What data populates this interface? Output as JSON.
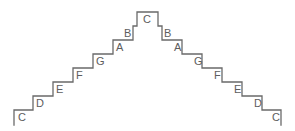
{
  "figure": {
    "name": "scale-staircase-diagram",
    "type": "diagram",
    "background_color": "#ffffff",
    "stroke_color": "#6a6a6a",
    "label_color": "#5d5d5d",
    "width": 295,
    "height": 131
  },
  "staircase": {
    "outline_path": "M 14,125 L 14,110 L 33,110 L 33,96 L 53,96 L 53,82 L 73,82 L 73,68 L 93,68 L 93,54 L 113,54 L 113,40 L 133,40 L 133,26 L 137,26 L 137,12 L 158,12 L 158,26 L 162,26 L 162,40 L 182,40 L 182,54 L 202,54 L 202,68 L 222,68 L 222,82 L 242,82 L 242,96 L 262,96 L 262,110 L 281,110 L 281,125",
    "ascending_labels": [
      {
        "text": "C",
        "x": 18,
        "y": 112
      },
      {
        "text": "D",
        "x": 36,
        "y": 98
      },
      {
        "text": "E",
        "x": 56,
        "y": 84
      },
      {
        "text": "F",
        "x": 76,
        "y": 70
      },
      {
        "text": "G",
        "x": 96,
        "y": 56
      },
      {
        "text": "A",
        "x": 116,
        "y": 42
      },
      {
        "text": "B",
        "x": 140,
        "y": 28
      },
      {
        "text": "C",
        "x": 143,
        "y": 14
      }
    ],
    "descending_labels": [
      {
        "text": "B",
        "x": 164,
        "y": 28
      },
      {
        "text": "A",
        "x": 178,
        "y": 42
      },
      {
        "text": "G",
        "x": 198,
        "y": 56
      },
      {
        "text": "F",
        "x": 218,
        "y": 70
      },
      {
        "text": "E",
        "x": 238,
        "y": 84
      },
      {
        "text": "D",
        "x": 258,
        "y": 98
      },
      {
        "text": "C",
        "x": 276,
        "y": 112
      }
    ]
  }
}
